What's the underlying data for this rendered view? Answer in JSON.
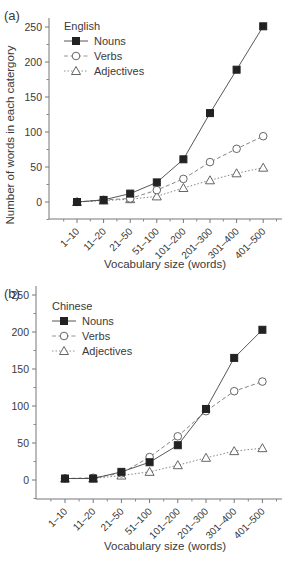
{
  "chart_data": [
    {
      "panel": "(a)",
      "type": "line",
      "title": "",
      "legend_title": "English",
      "xlabel": "Vocabulary size (words)",
      "ylabel": "Number of words in each catergory",
      "categories": [
        "1–10",
        "11–20",
        "21–50",
        "51–100",
        "101–200",
        "201–300",
        "301–400",
        "401–500"
      ],
      "yticks": [
        0,
        50,
        100,
        150,
        200,
        250
      ],
      "ylim": [
        -25,
        260
      ],
      "grid": false,
      "legend_position": "upper-left",
      "series": [
        {
          "name": "Nouns",
          "marker": "filled-square",
          "line": "solid",
          "values": [
            0,
            3,
            12,
            28,
            61,
            127,
            189,
            251
          ]
        },
        {
          "name": "Verbs",
          "marker": "open-circle",
          "line": "dashed",
          "values": [
            0,
            3,
            5,
            17,
            33,
            57,
            76,
            94
          ]
        },
        {
          "name": "Adjectives",
          "marker": "open-triangle",
          "line": "dotted",
          "values": [
            0,
            2,
            4,
            8,
            20,
            31,
            41,
            49
          ]
        }
      ]
    },
    {
      "panel": "(b)",
      "type": "line",
      "title": "",
      "legend_title": "Chinese",
      "xlabel": "Vocabulary size (words)",
      "ylabel": "",
      "categories": [
        "1–10",
        "11–20",
        "21–50",
        "51–100",
        "101–200",
        "201–300",
        "301–400",
        "401–500"
      ],
      "yticks": [
        0,
        50,
        100,
        150,
        200,
        250
      ],
      "ylim": [
        -25,
        260
      ],
      "grid": false,
      "legend_position": "upper-left",
      "series": [
        {
          "name": "Nouns",
          "marker": "filled-square",
          "line": "solid",
          "values": [
            2,
            2,
            11,
            24,
            47,
            96,
            165,
            203
          ]
        },
        {
          "name": "Verbs",
          "marker": "open-circle",
          "line": "dashed",
          "values": [
            2,
            3,
            9,
            31,
            59,
            93,
            120,
            133
          ]
        },
        {
          "name": "Adjectives",
          "marker": "open-triangle",
          "line": "dotted",
          "values": [
            2,
            2,
            6,
            11,
            20,
            30,
            39,
            43
          ]
        }
      ]
    }
  ]
}
